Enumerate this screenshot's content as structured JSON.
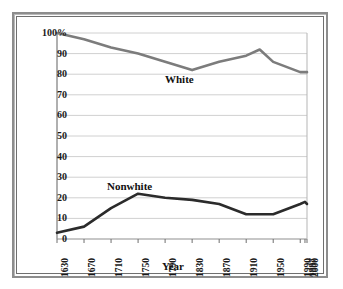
{
  "chart_data": {
    "type": "line",
    "title": "",
    "xlabel": "Year",
    "ylabel": "",
    "grid": true,
    "legend_position": "inline-annotation",
    "x": [
      1630,
      1670,
      1710,
      1750,
      1790,
      1830,
      1870,
      1910,
      1930,
      1950,
      1990,
      1997,
      2000
    ],
    "xtick_labels": [
      "1630",
      "1670",
      "1710",
      "1750",
      "1790",
      "1830",
      "1870",
      "1910",
      "1950",
      "1990",
      "1997",
      "2000"
    ],
    "ytick_labels": [
      "0",
      "10",
      "20",
      "30",
      "40",
      "50",
      "60",
      "70",
      "80",
      "90",
      "100%"
    ],
    "ylim": [
      0,
      100
    ],
    "xlim": [
      1630,
      2000
    ],
    "series": [
      {
        "name": "White",
        "color": "#7c7c7c",
        "values": [
          100,
          97,
          93,
          90,
          86,
          82,
          86,
          89,
          92,
          86,
          81,
          81,
          81
        ]
      },
      {
        "name": "Nonwhite",
        "color": "#2b2b2b",
        "values": [
          3,
          6,
          15,
          22,
          20,
          19,
          17,
          12,
          12,
          12,
          17,
          18,
          17
        ]
      }
    ],
    "annotations": [
      {
        "text": "White",
        "x": 1790,
        "y": 78
      },
      {
        "text": "Nonwhite",
        "x": 1718,
        "y": 27
      }
    ]
  },
  "axes": {
    "x_title": "Year",
    "y_ticks": [
      {
        "label": "100%",
        "value": 100
      },
      {
        "label": "90",
        "value": 90
      },
      {
        "label": "80",
        "value": 80
      },
      {
        "label": "70",
        "value": 70
      },
      {
        "label": "60",
        "value": 60
      },
      {
        "label": "50",
        "value": 50
      },
      {
        "label": "40",
        "value": 40
      },
      {
        "label": "30",
        "value": 30
      },
      {
        "label": "20",
        "value": 20
      },
      {
        "label": "10",
        "value": 10
      },
      {
        "label": "0",
        "value": 0
      }
    ],
    "x_ticks": [
      {
        "label": "1630",
        "value": 1630
      },
      {
        "label": "1670",
        "value": 1670
      },
      {
        "label": "1710",
        "value": 1710
      },
      {
        "label": "1750",
        "value": 1750
      },
      {
        "label": "1790",
        "value": 1790
      },
      {
        "label": "1830",
        "value": 1830
      },
      {
        "label": "1870",
        "value": 1870
      },
      {
        "label": "1910",
        "value": 1910
      },
      {
        "label": "1950",
        "value": 1950
      },
      {
        "label": "1990",
        "value": 1990
      },
      {
        "label": "1997",
        "value": 1997
      },
      {
        "label": "2000",
        "value": 2000
      }
    ]
  },
  "labels": {
    "white": "White",
    "nonwhite": "Nonwhite"
  },
  "style": {
    "grid_color": "#d0d0d0",
    "frame_color": "#8d8d8d",
    "plot_border_color": "#9a9a9a",
    "background": "#ffffff"
  }
}
